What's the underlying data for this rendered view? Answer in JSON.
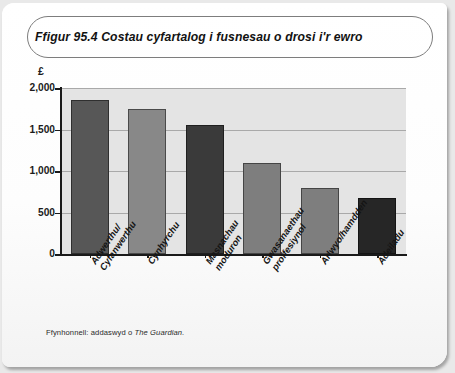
{
  "figure": {
    "title": "Ffigur 95.4 Costau cyfartalog i fusnesau o drosi i'r ewro",
    "source_prefix": "Ffynhonnell: addaswyd o ",
    "source_publication": "The Guardian."
  },
  "chart_data": {
    "type": "bar",
    "title": "Ffigur 95.4 Costau cyfartalog i fusnesau o drosi i'r ewro",
    "xlabel": "",
    "ylabel": "£",
    "ylim": [
      0,
      2000
    ],
    "grid": true,
    "legend": "none",
    "ytick_labels": [
      "2,000",
      "1,500",
      "1,000",
      "500",
      "0"
    ],
    "ytick_values": [
      2000,
      1500,
      1000,
      500,
      0
    ],
    "categories": [
      "Adwerthu/\nCyfanwerthu",
      "Cynhyrchu",
      "Masnachau\nmoduron",
      "Gwasanaethau\nproffesiynol",
      "Arlwyo/hamdden",
      "Adeiladu"
    ],
    "values": [
      1850,
      1750,
      1560,
      1100,
      790,
      670
    ],
    "bar_colors": [
      "#575757",
      "#888888",
      "#3a3a3a",
      "#7e7e7e",
      "#7e7e7e",
      "#262626"
    ],
    "plot_background": "#e4e4e4",
    "gridline_color": "#a9a9a9",
    "axis_color": "#1a1a1a"
  }
}
